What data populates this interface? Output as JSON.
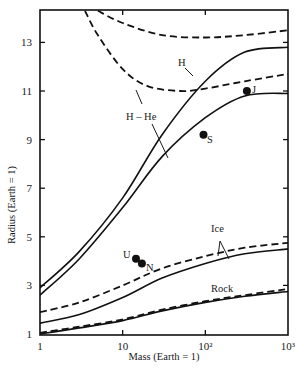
{
  "chart_data": {
    "type": "line",
    "title": "",
    "xlabel": "Mass (Earth = 1)",
    "ylabel": "Radius (Earth = 1)",
    "xscale": "log",
    "xlim": [
      1,
      1000
    ],
    "ylim": [
      1,
      14.3
    ],
    "grid": false,
    "legend": "none (inline curve labels)",
    "x_ticks": [
      {
        "value": 1,
        "label": "1"
      },
      {
        "value": 10,
        "label": "10"
      },
      {
        "value": 100,
        "label": "10²"
      },
      {
        "value": 1000,
        "label": "10³"
      }
    ],
    "y_ticks": [
      {
        "value": 1,
        "label": "1"
      },
      {
        "value": 3,
        "label": "3"
      },
      {
        "value": 5,
        "label": "5"
      },
      {
        "value": 7,
        "label": "7"
      },
      {
        "value": 9,
        "label": "9"
      },
      {
        "value": 11,
        "label": "11"
      },
      {
        "value": 13,
        "label": "13"
      }
    ],
    "series": [
      {
        "name": "H (cold, solid)",
        "style": "solid",
        "label": "H",
        "points": [
          [
            1,
            2.9
          ],
          [
            3,
            4.4
          ],
          [
            10,
            6.6
          ],
          [
            30,
            9.2
          ],
          [
            100,
            11.4
          ],
          [
            300,
            12.6
          ],
          [
            1000,
            12.8
          ]
        ]
      },
      {
        "name": "H-He (cold, solid)",
        "style": "solid",
        "label": "H – He",
        "points": [
          [
            1,
            2.6
          ],
          [
            3,
            4.1
          ],
          [
            10,
            6.2
          ],
          [
            30,
            8.3
          ],
          [
            100,
            9.9
          ],
          [
            300,
            10.8
          ],
          [
            1000,
            10.9
          ]
        ]
      },
      {
        "name": "H (hot, dashed)",
        "style": "dashed",
        "points": [
          [
            5,
            14.3
          ],
          [
            10,
            13.8
          ],
          [
            30,
            13.3
          ],
          [
            100,
            13.2
          ],
          [
            300,
            13.3
          ],
          [
            1000,
            13.5
          ]
        ]
      },
      {
        "name": "H-He (hot, dashed)",
        "style": "dashed",
        "points": [
          [
            3.5,
            14.3
          ],
          [
            5,
            13.3
          ],
          [
            10,
            11.9
          ],
          [
            20,
            11.2
          ],
          [
            50,
            11.0
          ],
          [
            100,
            11.1
          ],
          [
            300,
            11.4
          ],
          [
            1000,
            11.7
          ]
        ]
      },
      {
        "name": "Ice (dashed)",
        "style": "dashed",
        "label": "Ice",
        "points": [
          [
            1,
            1.9
          ],
          [
            3,
            2.3
          ],
          [
            10,
            3.0
          ],
          [
            30,
            3.7
          ],
          [
            100,
            4.2
          ],
          [
            300,
            4.55
          ],
          [
            1000,
            4.75
          ]
        ]
      },
      {
        "name": "Ice (solid)",
        "style": "solid",
        "label": "Ice",
        "points": [
          [
            1,
            1.45
          ],
          [
            3,
            1.8
          ],
          [
            10,
            2.5
          ],
          [
            30,
            3.3
          ],
          [
            100,
            3.9
          ],
          [
            300,
            4.3
          ],
          [
            1000,
            4.5
          ]
        ]
      },
      {
        "name": "Rock (dashed)",
        "style": "dashed",
        "label": "Rock",
        "points": [
          [
            1,
            1.05
          ],
          [
            3,
            1.3
          ],
          [
            10,
            1.6
          ],
          [
            30,
            2.0
          ],
          [
            100,
            2.35
          ],
          [
            300,
            2.6
          ],
          [
            1000,
            2.85
          ]
        ]
      },
      {
        "name": "Rock (solid)",
        "style": "solid",
        "label": "Rock",
        "points": [
          [
            1,
            1.0
          ],
          [
            3,
            1.25
          ],
          [
            10,
            1.55
          ],
          [
            30,
            1.95
          ],
          [
            100,
            2.3
          ],
          [
            300,
            2.55
          ],
          [
            1000,
            2.75
          ]
        ]
      }
    ],
    "planets": [
      {
        "name": "J",
        "mass": 318,
        "radius": 11.0
      },
      {
        "name": "S",
        "mass": 95,
        "radius": 9.2
      },
      {
        "name": "U",
        "mass": 14.5,
        "radius": 4.1
      },
      {
        "name": "N",
        "mass": 17.1,
        "radius": 3.9
      }
    ],
    "annotations": [
      "H",
      "H – He",
      "Ice",
      "Rock",
      "J",
      "S",
      "U",
      "N"
    ]
  },
  "labels": {
    "xlabel": "Mass (Earth = 1)",
    "ylabel": "Radius (Earth = 1)",
    "curve_H": "H",
    "curve_HHe": "H – He",
    "curve_Ice": "Ice",
    "curve_Rock": "Rock",
    "planet_J": "J",
    "planet_S": "S",
    "planet_U": "U",
    "planet_N": "N"
  }
}
